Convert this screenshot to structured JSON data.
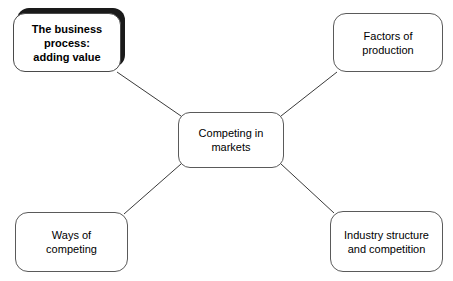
{
  "diagram": {
    "type": "mind-map",
    "title": "Competing in markets",
    "background_color": "#ffffff",
    "node_border_color": "#5a5a5a",
    "node_fill_color": "#ffffff",
    "connector_color": "#3a3a3a",
    "shadow_color": "#1a1a1a",
    "text_color": "#000000",
    "center": {
      "id": "competing-in-markets",
      "label": "Competing in\nmarkets",
      "emphasis": "normal"
    },
    "nodes": [
      {
        "id": "business-process",
        "label": "The business\nprocess:\nadding value",
        "emphasis": "bold-with-shadow",
        "position": "top-left"
      },
      {
        "id": "factors-of-production",
        "label": "Factors of\nproduction",
        "emphasis": "normal",
        "position": "top-right"
      },
      {
        "id": "ways-of-competing",
        "label": "Ways of\ncompeting",
        "emphasis": "normal",
        "position": "bottom-left"
      },
      {
        "id": "industry-structure",
        "label": "Industry structure\nand competition",
        "emphasis": "normal",
        "position": "bottom-right"
      }
    ],
    "connectors": [
      {
        "from": "competing-in-markets",
        "to": "business-process"
      },
      {
        "from": "competing-in-markets",
        "to": "factors-of-production"
      },
      {
        "from": "competing-in-markets",
        "to": "ways-of-competing"
      },
      {
        "from": "competing-in-markets",
        "to": "industry-structure"
      }
    ]
  }
}
